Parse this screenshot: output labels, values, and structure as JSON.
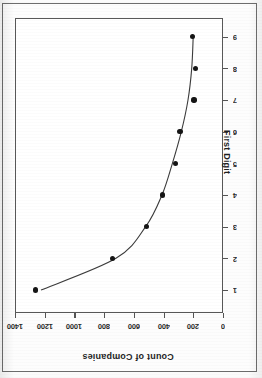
{
  "figure": {
    "kind": "scanned-scatter-with-fitted-curve",
    "orientation": "rotated-90-ccw",
    "background_color": "#fdfdfd",
    "frame_color": "#6d6d6d",
    "point_color": "#151515",
    "curve_color": "#3b3b3b"
  },
  "chart_data": {
    "type": "scatter",
    "title": "",
    "subtitle": "",
    "xlabel": "First Digit",
    "ylabel": "Count of Companies",
    "x": [
      1,
      2,
      3,
      4,
      5,
      6,
      7,
      8,
      9
    ],
    "values": [
      1260,
      745,
      515,
      405,
      320,
      290,
      195,
      185,
      205
    ],
    "categories": [
      "1",
      "2",
      "3",
      "4",
      "5",
      "6",
      "7",
      "8",
      "9"
    ],
    "series": [
      {
        "name": "Count of Companies",
        "values": [
          1260,
          745,
          515,
          405,
          320,
          290,
          195,
          185,
          205
        ]
      },
      {
        "name": "fitted curve",
        "values": [
          1225,
          720,
          520,
          410,
          340,
          280,
          235,
          210,
          200
        ]
      }
    ],
    "xlim": [
      0,
      9.6
    ],
    "ylim": [
      0,
      1400
    ],
    "xticks": [
      1,
      2,
      3,
      4,
      5,
      6,
      7,
      8,
      9
    ],
    "yticks": [
      0,
      200,
      400,
      600,
      800,
      1000,
      1200,
      1400
    ],
    "xtick_labels": [
      "1",
      "2",
      "3",
      "4",
      "5",
      "6",
      "7",
      "8",
      "9"
    ],
    "ytick_labels": [
      "0",
      "200",
      "400",
      "600",
      "800",
      "1000",
      "1200",
      "1400"
    ],
    "grid": false,
    "legend": "none",
    "annotations": []
  },
  "axes": {
    "x_title": "First Digit",
    "y_title": "Count of Companies",
    "x_tick_labels": [
      "1",
      "2",
      "3",
      "4",
      "5",
      "6",
      "7",
      "8",
      "9"
    ],
    "y_tick_labels": [
      "1400",
      "1200",
      "1000",
      "800",
      "600",
      "400",
      "200",
      "0"
    ]
  }
}
